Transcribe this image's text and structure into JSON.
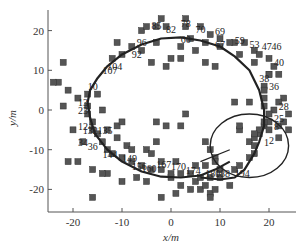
{
  "chart_data": {
    "type": "scatter",
    "title": "",
    "xlabel": "x/m",
    "ylabel": "y/m",
    "xlim": [
      -25,
      25
    ],
    "ylim": [
      -25,
      25
    ],
    "xticks": [
      -20,
      -10,
      0,
      10,
      20
    ],
    "yticks": [
      -20,
      -10,
      0,
      10,
      20
    ],
    "xtick_labels": [
      "-20",
      "-10",
      "0",
      "10",
      "20"
    ],
    "ytick_labels": [
      "-20",
      "-10",
      "0",
      "10",
      "20"
    ],
    "grid": false,
    "legend": null,
    "series": [
      {
        "name": "landmarks",
        "marker": "square",
        "color": "#555555",
        "points": [
          [
            -2,
            23
          ],
          [
            -3,
            21
          ],
          [
            -11,
            17
          ],
          [
            -8,
            16
          ],
          [
            -10,
            14
          ],
          [
            -12,
            13
          ],
          [
            -6,
            15
          ],
          [
            -3,
            17
          ],
          [
            2,
            16
          ],
          [
            5,
            15
          ],
          [
            0,
            13
          ],
          [
            2,
            13
          ],
          [
            -4,
            12
          ],
          [
            -1,
            11
          ],
          [
            -22,
            12
          ],
          [
            -23,
            7
          ],
          [
            -24,
            7
          ],
          [
            -21,
            5
          ],
          [
            -22,
            1
          ],
          [
            -19,
            3
          ],
          [
            -25,
            0
          ],
          [
            -15,
            4
          ],
          [
            -14,
            0
          ],
          [
            -11,
            -4
          ],
          [
            -20,
            -5
          ],
          [
            -18,
            -8
          ],
          [
            -19,
            -13
          ],
          [
            -21,
            -13
          ],
          [
            -16,
            -15
          ],
          [
            -13,
            -16
          ],
          [
            -14,
            -16
          ],
          [
            -10,
            -18
          ],
          [
            -7,
            -17
          ],
          [
            -5,
            -18
          ],
          [
            -9,
            -9
          ],
          [
            -5,
            -10
          ],
          [
            -3,
            -8
          ],
          [
            -4,
            -11
          ],
          [
            -13,
            -5
          ],
          [
            -10,
            -3
          ],
          [
            -11,
            -7
          ],
          [
            -8,
            -10
          ],
          [
            -3,
            -3
          ],
          [
            -1,
            -4
          ],
          [
            2,
            -4
          ],
          [
            -16,
            -22
          ],
          [
            -2,
            -22
          ],
          [
            1,
            -21
          ],
          [
            4,
            -20
          ],
          [
            6,
            -20
          ],
          [
            2,
            -19
          ],
          [
            0,
            -17
          ],
          [
            5,
            -18
          ],
          [
            7,
            -19
          ],
          [
            8,
            -21
          ],
          [
            8,
            -22
          ],
          [
            9,
            -20
          ],
          [
            10,
            -17
          ],
          [
            12,
            -19
          ],
          [
            -25,
            -25
          ],
          [
            9,
            -12
          ],
          [
            8,
            -10
          ],
          [
            7,
            -8
          ],
          [
            9,
            -13
          ],
          [
            10,
            -15
          ],
          [
            13,
            -15
          ],
          [
            14,
            -14
          ],
          [
            16,
            -12
          ],
          [
            17,
            -11
          ],
          [
            16,
            -8
          ],
          [
            18,
            -6
          ],
          [
            19,
            -4
          ],
          [
            20,
            -3
          ],
          [
            22,
            -4
          ],
          [
            14,
            -5
          ],
          [
            3,
            21
          ],
          [
            6,
            21
          ],
          [
            8,
            19
          ],
          [
            10,
            18
          ],
          [
            13,
            17
          ],
          [
            15,
            17
          ],
          [
            17,
            15
          ],
          [
            18,
            14
          ],
          [
            20,
            13
          ],
          [
            21,
            11
          ],
          [
            20,
            9
          ],
          [
            22,
            9
          ],
          [
            19,
            6
          ],
          [
            23,
            3
          ],
          [
            21,
            0
          ],
          [
            20,
            -1
          ],
          [
            22,
            2
          ],
          [
            23,
            -3
          ],
          [
            20,
            -5
          ],
          [
            22,
            -7
          ],
          [
            24,
            -5
          ],
          [
            24,
            -1
          ],
          [
            16,
            2
          ],
          [
            13,
            2
          ],
          [
            7,
            12
          ],
          [
            9,
            11
          ],
          [
            3,
            -1
          ],
          [
            14,
            -4
          ],
          [
            17,
            -7
          ],
          [
            17,
            -9
          ],
          [
            -6,
            20
          ],
          [
            -5,
            21
          ],
          [
            -1,
            21
          ],
          [
            3,
            23
          ],
          [
            4,
            18
          ],
          [
            7,
            17
          ],
          [
            10,
            16
          ],
          [
            12,
            17
          ],
          [
            14,
            14
          ],
          [
            17,
            12
          ],
          [
            20,
            9
          ],
          [
            19,
            5
          ],
          [
            19,
            3
          ],
          [
            19,
            1
          ],
          [
            19,
            -3
          ],
          [
            18,
            -5
          ],
          [
            17,
            -6
          ],
          [
            -17,
            4
          ],
          [
            -17,
            1
          ],
          [
            -17,
            -1
          ],
          [
            -16,
            -3
          ],
          [
            -16,
            -5
          ],
          [
            -15,
            -6
          ],
          [
            -14,
            -8
          ],
          [
            -13,
            -10
          ],
          [
            -12,
            -11
          ],
          [
            -10,
            -12
          ],
          [
            -8,
            -13
          ],
          [
            -6,
            -14
          ],
          [
            -4,
            -15
          ],
          [
            -2,
            -15
          ],
          [
            0,
            -16
          ],
          [
            2,
            -16
          ],
          [
            4,
            -16
          ],
          [
            6,
            -17
          ],
          [
            8,
            -17
          ],
          [
            -2,
            -13
          ],
          [
            1,
            -13
          ],
          [
            5,
            -14
          ],
          [
            7,
            -14
          ]
        ]
      }
    ],
    "trajectory": {
      "name": "path",
      "color": "#222222",
      "points": [
        [
          12,
          -13
        ],
        [
          9,
          -15
        ],
        [
          6,
          -16.5
        ],
        [
          2,
          -17
        ],
        [
          -2,
          -16.8
        ],
        [
          -6,
          -15.5
        ],
        [
          -10,
          -13
        ],
        [
          -13,
          -10
        ],
        [
          -15.5,
          -6
        ],
        [
          -16.5,
          -2
        ],
        [
          -17,
          2
        ],
        [
          -16.5,
          5
        ],
        [
          -15,
          8
        ],
        [
          -13,
          11
        ],
        [
          -10,
          14
        ],
        [
          -6,
          16.5
        ],
        [
          -2,
          18
        ],
        [
          2,
          18.3
        ],
        [
          6,
          17.5
        ],
        [
          10,
          16
        ],
        [
          13,
          13.5
        ],
        [
          16,
          10
        ],
        [
          18,
          5
        ],
        [
          19,
          0
        ],
        [
          19,
          -4
        ],
        [
          18,
          -8
        ],
        [
          17,
          -11
        ],
        [
          15,
          -15
        ],
        [
          13,
          -17
        ],
        [
          10,
          -17.5
        ],
        [
          6,
          -17
        ]
      ]
    },
    "loop": {
      "name": "circle",
      "color": "#222222",
      "center": [
        16,
        -9
      ],
      "radius": 8
    },
    "point_labels": [
      {
        "text": "85",
        "x": -4,
        "y": 20.5
      },
      {
        "text": "82",
        "x": -1,
        "y": 19.5
      },
      {
        "text": "78",
        "x": 2,
        "y": 21
      },
      {
        "text": "70",
        "x": 5,
        "y": 19.5
      },
      {
        "text": "69",
        "x": 9,
        "y": 19
      },
      {
        "text": "60",
        "x": 2,
        "y": 17
      },
      {
        "text": "67",
        "x": 9,
        "y": 15.5
      },
      {
        "text": "59",
        "x": 13,
        "y": 16.5
      },
      {
        "text": "53",
        "x": 16,
        "y": 15.5
      },
      {
        "text": "47",
        "x": 18.5,
        "y": 15
      },
      {
        "text": "46",
        "x": 20.5,
        "y": 15
      },
      {
        "text": "40",
        "x": 21,
        "y": 11
      },
      {
        "text": "38",
        "x": 18,
        "y": 7
      },
      {
        "text": "36",
        "x": 20,
        "y": 5
      },
      {
        "text": "28",
        "x": 22,
        "y": 0
      },
      {
        "text": "25",
        "x": 21,
        "y": -3
      },
      {
        "text": "8",
        "x": 21,
        "y": -5
      },
      {
        "text": "1",
        "x": 19,
        "y": -9
      },
      {
        "text": "2",
        "x": 20,
        "y": -8.5
      },
      {
        "text": "96",
        "x": -7,
        "y": 16
      },
      {
        "text": "92",
        "x": -8,
        "y": 13
      },
      {
        "text": "104",
        "x": -13,
        "y": 10
      },
      {
        "text": "107",
        "x": -14,
        "y": 9
      },
      {
        "text": "10",
        "x": -17,
        "y": 5
      },
      {
        "text": "13",
        "x": -19,
        "y": 1
      },
      {
        "text": "23",
        "x": -19,
        "y": -1
      },
      {
        "text": "124",
        "x": -19,
        "y": -5
      },
      {
        "text": "132",
        "x": -18,
        "y": -6
      },
      {
        "text": "135",
        "x": -15,
        "y": -6
      },
      {
        "text": "34",
        "x": -19,
        "y": -9
      },
      {
        "text": "36",
        "x": -17,
        "y": -10
      },
      {
        "text": "144",
        "x": -14,
        "y": -12
      },
      {
        "text": "149",
        "x": -10,
        "y": -13
      },
      {
        "text": "156",
        "x": -8,
        "y": -15
      },
      {
        "text": "160",
        "x": -6,
        "y": -15.5
      },
      {
        "text": "167",
        "x": -3,
        "y": -14.5
      },
      {
        "text": "170",
        "x": 0,
        "y": -15
      },
      {
        "text": "174",
        "x": 3,
        "y": -16
      },
      {
        "text": "180",
        "x": 7,
        "y": -17
      },
      {
        "text": "188",
        "x": 9,
        "y": -17
      },
      {
        "text": "194",
        "x": 13,
        "y": -17
      }
    ]
  }
}
